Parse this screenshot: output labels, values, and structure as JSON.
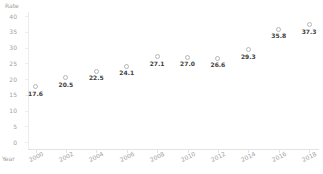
{
  "chart": {
    "y_axis_title": "Rate",
    "x_axis_title": "Year",
    "y_ticks": [
      40,
      35,
      30,
      25,
      20,
      15,
      10,
      5,
      0
    ],
    "colors": {
      "background": "#ffffff",
      "axis_text": "#a2a2a2",
      "axis_line": "#e3e3e3",
      "marker_outline": "#b5b5b5",
      "data_label": "#3d3d3d"
    }
  },
  "chart_data": {
    "type": "scatter",
    "title": "",
    "xlabel": "Year",
    "ylabel": "Rate",
    "x": [
      2000,
      2002,
      2004,
      2006,
      2008,
      2010,
      2012,
      2014,
      2016,
      2018
    ],
    "values": [
      17.6,
      20.5,
      22.5,
      24.1,
      27.1,
      27.0,
      26.6,
      29.3,
      35.8,
      37.3
    ],
    "point_labels": [
      "17.6",
      "20.5",
      "22.5",
      "24.1",
      "27.1",
      "27.0",
      "26.6",
      "29.3",
      "35.8",
      "37.3"
    ],
    "ylim": [
      0,
      40
    ],
    "xlim": [
      2000,
      2018
    ],
    "grid": false,
    "legend": false,
    "marker_style": "open-circle",
    "x_tick_rotation": -27,
    "point_labels_position": "below"
  }
}
